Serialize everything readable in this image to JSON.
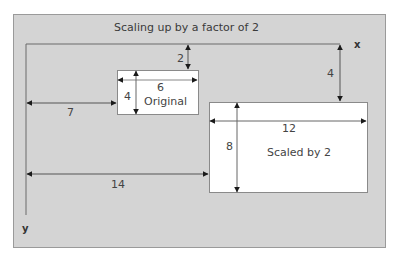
{
  "diagram": {
    "title": "Scaling up by a factor of 2",
    "axes": {
      "x_label": "x",
      "y_label": "y"
    },
    "original": {
      "label": "Original",
      "width": "6",
      "height": "4",
      "offset_x": "7",
      "offset_y": "2"
    },
    "scaled": {
      "label": "Scaled by 2",
      "width": "12",
      "height": "8",
      "offset_x": "14",
      "offset_y": "4"
    },
    "colors": {
      "panel": "#d4d4d4",
      "box": "#ffffff",
      "line": "#5a5a5a",
      "arrow": "#1a1a1a"
    }
  }
}
